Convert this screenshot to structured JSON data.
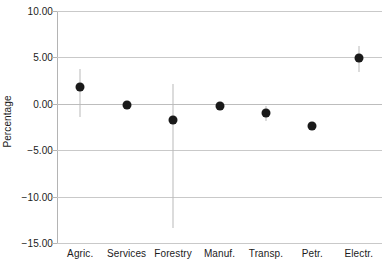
{
  "chart_data": {
    "type": "scatter",
    "title": "",
    "subtitle": "",
    "xlabel": "",
    "ylabel": "Percentage",
    "ylim": [
      -15.0,
      10.0
    ],
    "yticks": [
      10.0,
      5.0,
      0.0,
      -5.0,
      -10.0,
      -15.0
    ],
    "ytick_labels": [
      "10.00",
      "5.00",
      "0.00",
      "-5.00",
      "-10.00",
      "-15.00"
    ],
    "grid": true,
    "legend": null,
    "categories": [
      "Agric.",
      "Services",
      "Forestry",
      "Manuf.",
      "Transp.",
      "Petr.",
      "Electr."
    ],
    "values": [
      1.8,
      -0.15,
      -1.7,
      -0.25,
      -1.0,
      -2.4,
      4.9
    ],
    "error_low": [
      -1.4,
      -0.15,
      -13.4,
      -0.6,
      -1.9,
      -2.4,
      3.4
    ],
    "error_high": [
      3.8,
      -0.15,
      2.1,
      0.1,
      -0.2,
      -2.4,
      6.2
    ],
    "series": [
      {
        "name": "Percentage",
        "points": [
          {
            "category": "Agric.",
            "value": 1.8,
            "low": -1.4,
            "high": 3.8
          },
          {
            "category": "Services",
            "value": -0.15,
            "low": -0.15,
            "high": -0.15
          },
          {
            "category": "Forestry",
            "value": -1.7,
            "low": -13.4,
            "high": 2.1
          },
          {
            "category": "Manuf.",
            "value": -0.25,
            "low": -0.6,
            "high": 0.1
          },
          {
            "category": "Transp.",
            "value": -1.0,
            "low": -1.9,
            "high": -0.2
          },
          {
            "category": "Petr.",
            "value": -2.4,
            "low": -2.4,
            "high": -2.4
          },
          {
            "category": "Electr.",
            "value": 4.9,
            "low": 3.4,
            "high": 6.2
          }
        ]
      }
    ],
    "colors": {
      "marker": "#1a1a1a",
      "errorbar": "#b9b9b9",
      "gridline": "#c9c9c9",
      "axis": "#b4b4b4",
      "text": "#1b1b1b",
      "background": "#ffffff"
    }
  }
}
